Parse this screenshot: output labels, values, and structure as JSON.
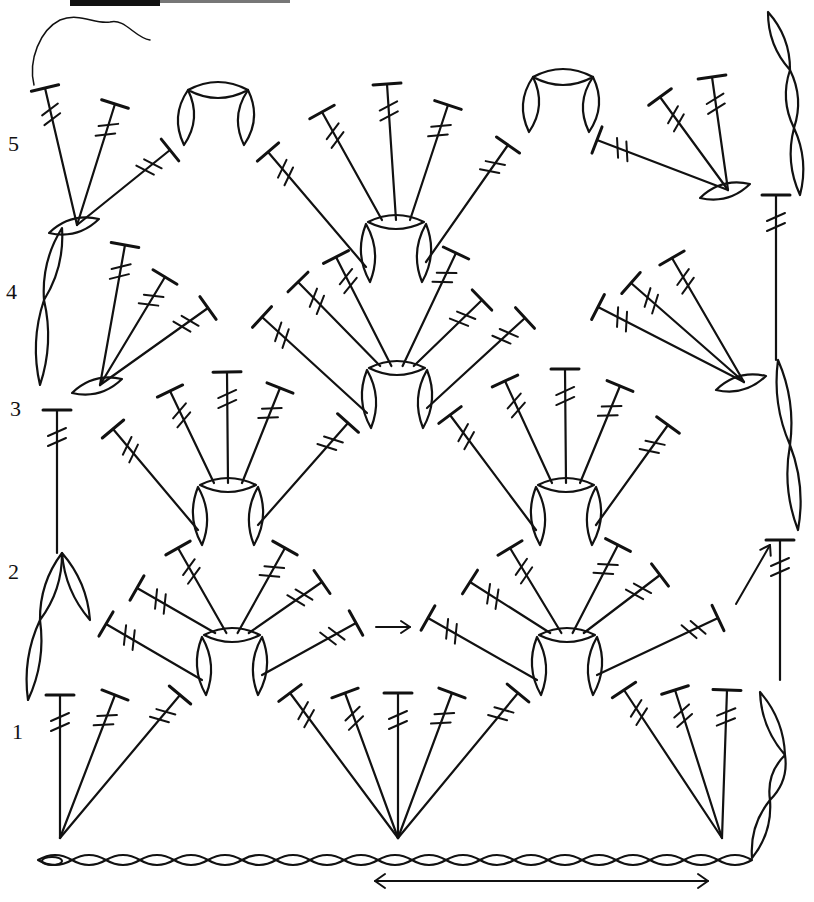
{
  "diagram": {
    "type": "crochet-stitch-chart",
    "ink_color": "#111111",
    "background": "#ffffff",
    "row_labels": [
      {
        "label": "5",
        "x": 8,
        "y": 145
      },
      {
        "label": "4",
        "x": 6,
        "y": 293
      },
      {
        "label": "3",
        "x": 10,
        "y": 410
      },
      {
        "label": "2",
        "x": 8,
        "y": 573
      },
      {
        "label": "1",
        "x": 12,
        "y": 733
      }
    ],
    "legend_symbols": {
      "chain": "chain-stitch (oval)",
      "treble": "treble crochet (T-bar with 2 slashes)",
      "arrow": "direction-arrow"
    },
    "foundation_chain": {
      "x0": 38,
      "x1": 752,
      "y": 860,
      "count": 21
    },
    "bottom_arrow": {
      "x0": 375,
      "x1": 708,
      "y": 881,
      "direction": "both"
    },
    "row1_turning_chain": [
      [
        752,
        858
      ],
      [
        770,
        800
      ],
      [
        785,
        755
      ],
      [
        760,
        692
      ]
    ],
    "row2_turning": [
      [
        28,
        700
      ],
      [
        40,
        620
      ],
      [
        62,
        553
      ]
    ],
    "row3_turning_post": {
      "x": 57,
      "y0": 410,
      "y1": 553
    },
    "row4_turning": [
      [
        40,
        385
      ],
      [
        44,
        300
      ],
      [
        62,
        228
      ]
    ],
    "row4_right_chain": [
      [
        798,
        530
      ],
      [
        790,
        445
      ],
      [
        778,
        360
      ]
    ],
    "row5_right_chain": [
      [
        800,
        195
      ],
      [
        794,
        128
      ],
      [
        790,
        70
      ],
      [
        768,
        12
      ]
    ],
    "row5_post_right": {
      "x": 776,
      "y0": 195,
      "y1": 360
    },
    "row2_post_right": {
      "x": 780,
      "y0": 540,
      "y1": 680
    },
    "top_left_scribble": true,
    "arrows": [
      {
        "x0": 376,
        "y0": 627,
        "x1": 410,
        "y1": 627
      },
      {
        "x0": 736,
        "y0": 604,
        "x1": 770,
        "y1": 545
      }
    ],
    "row1_fans": [
      {
        "base": [
          60,
          838
        ],
        "tips": [
          [
            60,
            695
          ],
          [
            115,
            695
          ],
          [
            180,
            695
          ]
        ]
      },
      {
        "base": [
          398,
          838
        ],
        "tips": [
          [
            290,
            693
          ],
          [
            345,
            693
          ],
          [
            398,
            693
          ],
          [
            452,
            693
          ],
          [
            518,
            693
          ]
        ]
      },
      {
        "base": [
          722,
          838
        ],
        "tips": [
          [
            624,
            690
          ],
          [
            675,
            690
          ],
          [
            727,
            690
          ]
        ]
      }
    ],
    "row2_shells": [
      {
        "cx": 232,
        "cy": 635,
        "tips": [
          [
            106,
            624
          ],
          [
            137,
            588
          ],
          [
            178,
            548
          ],
          [
            285,
            548
          ],
          [
            322,
            582
          ],
          [
            356,
            623
          ]
        ]
      },
      {
        "cx": 567,
        "cy": 635,
        "tips": [
          [
            428,
            618
          ],
          [
            470,
            582
          ],
          [
            510,
            548
          ],
          [
            618,
            545
          ],
          [
            660,
            575
          ],
          [
            718,
            618
          ]
        ]
      }
    ],
    "row3_shells": [
      {
        "cx": 228,
        "cy": 485,
        "tips": [
          [
            113,
            429
          ],
          [
            170,
            391
          ],
          [
            227,
            372
          ],
          [
            280,
            388
          ],
          [
            348,
            423
          ]
        ]
      },
      {
        "cx": 566,
        "cy": 485,
        "tips": [
          [
            450,
            415
          ],
          [
            505,
            381
          ],
          [
            565,
            369
          ],
          [
            620,
            386
          ],
          [
            668,
            425
          ]
        ]
      }
    ],
    "row4_shells": [
      {
        "cx": 397,
        "cy": 368,
        "tips": [
          [
            262,
            317
          ],
          [
            298,
            282
          ],
          [
            336,
            257
          ],
          [
            456,
            253
          ],
          [
            482,
            300
          ],
          [
            525,
            318
          ]
        ]
      },
      {
        "cx": 744,
        "cy": 382,
        "tips": [
          [
            598,
            307
          ],
          [
            631,
            283
          ],
          [
            672,
            258
          ]
        ]
      },
      {
        "cx": 100,
        "cy": 385,
        "tips": [
          [
            125,
            245
          ],
          [
            165,
            277
          ],
          [
            208,
            308
          ]
        ]
      }
    ],
    "row5_shells": [
      {
        "cx": 396,
        "cy": 222,
        "tips": [
          [
            268,
            152
          ],
          [
            322,
            112
          ],
          [
            387,
            84
          ],
          [
            448,
            105
          ],
          [
            508,
            145
          ]
        ]
      },
      {
        "cx": 77,
        "cy": 225,
        "tips": [
          [
            45,
            88
          ],
          [
            115,
            104
          ],
          [
            170,
            150
          ]
        ]
      },
      {
        "cx": 728,
        "cy": 190,
        "tips": [
          [
            597,
            140
          ],
          [
            660,
            97
          ],
          [
            712,
            77
          ]
        ]
      }
    ],
    "top_arches": [
      {
        "cx": 218,
        "cy": 95
      },
      {
        "cx": 563,
        "cy": 82
      }
    ]
  }
}
